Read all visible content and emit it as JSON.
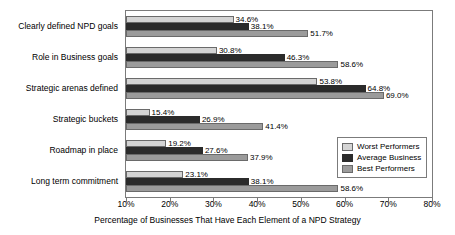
{
  "chart_data": {
    "type": "bar",
    "orientation": "horizontal",
    "title": "",
    "xlabel": "Percentage of Businesses That Have Each Element of a NPD Strategy",
    "ylabel": "",
    "xlim": [
      10,
      80
    ],
    "xticks": [
      "10%",
      "20%",
      "30%",
      "40%",
      "50%",
      "60%",
      "70%",
      "80%"
    ],
    "xtick_values": [
      10,
      20,
      30,
      40,
      50,
      60,
      70,
      80
    ],
    "grid": false,
    "legend_position": "lower-right-inside",
    "categories": [
      "Clearly defined NPD goals",
      "Role in Business goals",
      "Strategic arenas defined",
      "Strategic buckets",
      "Roadmap in place",
      "Long term commitment"
    ],
    "series": [
      {
        "name": "Worst Performers",
        "color": "#d4d4d4",
        "values": [
          34.6,
          30.8,
          53.8,
          15.4,
          19.2,
          23.1
        ],
        "labels": [
          "34.6%",
          "30.8%",
          "53.8%",
          "15.4%",
          "19.2%",
          "23.1%"
        ]
      },
      {
        "name": "Average Business",
        "color": "#2b2b2b",
        "values": [
          38.1,
          46.3,
          64.8,
          26.9,
          27.6,
          38.1
        ],
        "labels": [
          "38.1%",
          "46.3%",
          "64.8%",
          "26.9%",
          "27.6%",
          "38.1%"
        ]
      },
      {
        "name": "Best Performers",
        "color": "#9b9b9b",
        "values": [
          51.7,
          58.6,
          69.0,
          41.4,
          37.9,
          58.6
        ],
        "labels": [
          "51.7%",
          "58.6%",
          "69.0%",
          "41.4%",
          "37.9%",
          "58.6%"
        ]
      }
    ]
  }
}
